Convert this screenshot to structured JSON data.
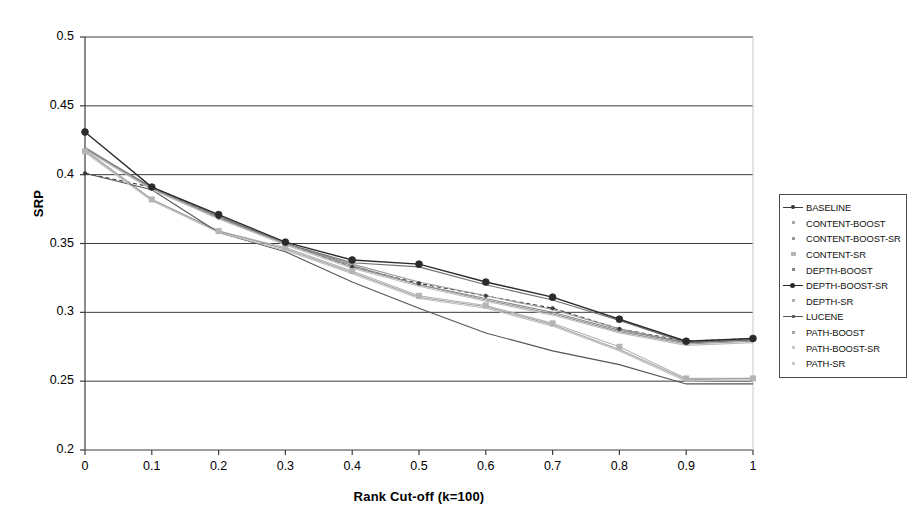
{
  "chart_data": {
    "type": "line",
    "title": "",
    "xlabel": "Rank Cut-off (k=100)",
    "ylabel": "SRP",
    "xlim": [
      0,
      1
    ],
    "ylim": [
      0.2,
      0.5
    ],
    "xticks": [
      "0",
      "0.1",
      "0.2",
      "0.3",
      "0.4",
      "0.5",
      "0.6",
      "0.7",
      "0.8",
      "0.9",
      "1"
    ],
    "yticks": [
      "0.2",
      "0.25",
      "0.3",
      "0.35",
      "0.4",
      "0.45",
      "0.5"
    ],
    "x": [
      0,
      0.1,
      0.2,
      0.3,
      0.4,
      0.5,
      0.6,
      0.7,
      0.8,
      0.9,
      1
    ],
    "grid": "horizontal",
    "legend_position": "right",
    "series": [
      {
        "name": "BASELINE",
        "color": "#3a3a3a",
        "marker": "dot-small",
        "dash": "4 3",
        "values": [
          0.401,
          0.391,
          0.369,
          0.35,
          0.333,
          0.321,
          0.312,
          0.303,
          0.288,
          0.279,
          0.281
        ]
      },
      {
        "name": "CONTENT-BOOST",
        "color": "#9a9a9a",
        "marker": "none",
        "dash": "none",
        "values": [
          0.419,
          0.39,
          0.369,
          0.35,
          0.335,
          0.322,
          0.312,
          0.302,
          0.288,
          0.278,
          0.28
        ]
      },
      {
        "name": "CONTENT-BOOST-SR",
        "color": "#888888",
        "marker": "none",
        "dash": "none",
        "values": [
          0.42,
          0.39,
          0.369,
          0.35,
          0.334,
          0.32,
          0.31,
          0.3,
          0.287,
          0.278,
          0.28
        ]
      },
      {
        "name": "CONTENT-SR",
        "color": "#b4b4b4",
        "marker": "square",
        "dash": "none",
        "values": [
          0.417,
          0.382,
          0.359,
          0.347,
          0.33,
          0.312,
          0.305,
          0.292,
          0.275,
          0.252,
          0.252
        ]
      },
      {
        "name": "DEPTH-BOOST",
        "color": "#6f6f6f",
        "marker": "none",
        "dash": "none",
        "values": [
          0.419,
          0.391,
          0.37,
          0.35,
          0.336,
          0.333,
          0.32,
          0.309,
          0.294,
          0.278,
          0.28
        ]
      },
      {
        "name": "DEPTH-BOOST-SR",
        "color": "#2b2b2b",
        "marker": "dot-large",
        "dash": "none",
        "values": [
          0.431,
          0.391,
          0.371,
          0.351,
          0.338,
          0.335,
          0.322,
          0.311,
          0.295,
          0.279,
          0.281
        ]
      },
      {
        "name": "DEPTH-SR",
        "color": "#a0a0a0",
        "marker": "none",
        "dash": "none",
        "values": [
          0.418,
          0.382,
          0.359,
          0.346,
          0.329,
          0.311,
          0.304,
          0.291,
          0.273,
          0.251,
          0.252
        ]
      },
      {
        "name": "LUCENE",
        "color": "#555555",
        "marker": "none",
        "dash": "none",
        "values": [
          0.401,
          0.389,
          0.358,
          0.344,
          0.322,
          0.303,
          0.285,
          0.272,
          0.262,
          0.248,
          0.248
        ]
      },
      {
        "name": "PATH-BOOST",
        "color": "#949494",
        "marker": "none",
        "dash": "none",
        "values": [
          0.419,
          0.39,
          0.368,
          0.35,
          0.333,
          0.32,
          0.309,
          0.299,
          0.286,
          0.277,
          0.279
        ]
      },
      {
        "name": "PATH-BOOST-SR",
        "color": "#bdbdbd",
        "marker": "none",
        "dash": "none",
        "values": [
          0.418,
          0.389,
          0.368,
          0.349,
          0.332,
          0.319,
          0.308,
          0.298,
          0.285,
          0.276,
          0.278
        ]
      },
      {
        "name": "PATH-SR",
        "color": "#c2c2c2",
        "marker": "none",
        "dash": "none",
        "values": [
          0.416,
          0.381,
          0.358,
          0.345,
          0.328,
          0.31,
          0.303,
          0.29,
          0.272,
          0.25,
          0.251
        ]
      }
    ]
  }
}
